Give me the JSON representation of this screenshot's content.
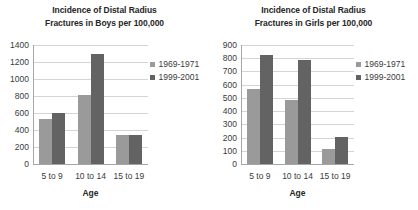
{
  "figure": {
    "background": "#ffffff",
    "series_colors": {
      "1969-1971": "#9a9a9a",
      "1999-2001": "#636363"
    }
  },
  "panels": [
    {
      "id": "boys",
      "title": "Incidence of Distal Radius\nFractures in Boys per 100,000",
      "xlabel": "Age",
      "categories": [
        "5 to 9",
        "10 to 14",
        "15 to 19"
      ],
      "yticks": [
        "0",
        "200",
        "400",
        "600",
        "800",
        "1000",
        "1200",
        "1400"
      ],
      "legend": [
        "1969-1971",
        "1999-2001"
      ]
    },
    {
      "id": "girls",
      "title": "Incidence of Distal Radius\nFractures in Girls per 100,000",
      "xlabel": "Age",
      "categories": [
        "5 to 9",
        "10 to 14",
        "15 to 19"
      ],
      "yticks": [
        "0",
        "100",
        "200",
        "300",
        "400",
        "500",
        "600",
        "700",
        "800",
        "900"
      ],
      "legend": [
        "1969-1971",
        "1999-2001"
      ]
    }
  ],
  "chart_data": [
    {
      "type": "bar",
      "id": "boys",
      "title": "Incidence of Distal Radius Fractures in Boys per 100,000",
      "xlabel": "Age",
      "ylabel": "",
      "categories": [
        "5 to 9",
        "10 to 14",
        "15 to 19"
      ],
      "series": [
        {
          "name": "1969-1971",
          "color": "#9a9a9a",
          "values": [
            530,
            810,
            340
          ]
        },
        {
          "name": "1999-2001",
          "color": "#636363",
          "values": [
            595,
            1300,
            340
          ]
        }
      ],
      "ylim": [
        0,
        1400
      ],
      "ytick_step": 200,
      "grid": true,
      "legend_position": "right"
    },
    {
      "type": "bar",
      "id": "girls",
      "title": "Incidence of Distal Radius Fractures in Girls per 100,000",
      "xlabel": "Age",
      "ylabel": "",
      "categories": [
        "5 to 9",
        "10 to 14",
        "15 to 19"
      ],
      "series": [
        {
          "name": "1969-1971",
          "color": "#9a9a9a",
          "values": [
            565,
            485,
            110
          ]
        },
        {
          "name": "1999-2001",
          "color": "#636363",
          "values": [
            825,
            790,
            205
          ]
        }
      ],
      "ylim": [
        0,
        900
      ],
      "ytick_step": 100,
      "grid": true,
      "legend_position": "right"
    }
  ]
}
